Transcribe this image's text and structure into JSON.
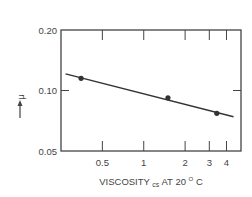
{
  "chart_data": {
    "type": "line",
    "title": "",
    "xlabel": "VISCOSITY",
    "xlabel_sub": "cs",
    "xlabel_suffix": "AT 20",
    "xlabel_sup": "O",
    "xlabel_unit": "C",
    "ylabel": "μ",
    "ylabel_arrow": "→",
    "xscale": "log",
    "yscale": "log",
    "xlim": [
      0.25,
      5.1
    ],
    "ylim": [
      0.05,
      0.2
    ],
    "x_ticks": [
      0.5,
      1,
      2,
      3,
      4
    ],
    "x_tick_labels": [
      "0.5",
      "1",
      "2",
      "3",
      "4"
    ],
    "y_ticks": [
      0.05,
      0.1,
      0.2
    ],
    "y_tick_labels": [
      "0.05",
      "0.10",
      "0.20"
    ],
    "grid": false,
    "legend": null,
    "series": [
      {
        "name": "μ vs viscosity",
        "markers": true,
        "x": [
          0.35,
          1.5,
          3.4
        ],
        "y": [
          0.115,
          0.092,
          0.077
        ]
      }
    ],
    "fit_line": {
      "x": [
        0.27,
        4.5
      ],
      "y": [
        0.121,
        0.074
      ]
    }
  },
  "colors": {
    "axis": "#444444",
    "line": "#333333",
    "text": "#444444"
  }
}
